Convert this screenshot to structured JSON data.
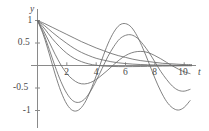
{
  "chart_data": {
    "type": "line",
    "title": "",
    "xlabel": "t",
    "ylabel": "y",
    "xlim": [
      0,
      10.6
    ],
    "ylim": [
      -1.15,
      1.08
    ],
    "grid": false,
    "legend": null,
    "xticks": [
      2,
      4,
      6,
      8,
      10
    ],
    "xtick_labels": [
      "2",
      "4",
      "6",
      "8",
      "10"
    ],
    "yticks": [
      -1,
      -0.5,
      0.5,
      1
    ],
    "ytick_labels": [
      "-1",
      "-0.5",
      "0.5",
      "1"
    ],
    "series": [
      {
        "name": "overdamped-slowest",
        "color": "#6b6b6b",
        "x": [
          0,
          0.5,
          1,
          1.5,
          2,
          2.5,
          3,
          3.5,
          4,
          4.5,
          5,
          5.5,
          6,
          6.5,
          7,
          7.5,
          8,
          8.5,
          9,
          9.5,
          10,
          10.5
        ],
        "y": [
          1.0,
          0.93,
          0.85,
          0.77,
          0.69,
          0.61,
          0.53,
          0.46,
          0.39,
          0.33,
          0.27,
          0.22,
          0.18,
          0.14,
          0.11,
          0.09,
          0.07,
          0.05,
          0.04,
          0.03,
          0.02,
          0.02
        ]
      },
      {
        "name": "overdamped-mid",
        "color": "#6b6b6b",
        "x": [
          0,
          0.5,
          1,
          1.5,
          2,
          2.5,
          3,
          3.5,
          4,
          4.5,
          5,
          5.5,
          6,
          6.5,
          7,
          7.5,
          8,
          8.5,
          9,
          9.5,
          10,
          10.5
        ],
        "y": [
          1.0,
          0.88,
          0.74,
          0.61,
          0.49,
          0.38,
          0.29,
          0.22,
          0.16,
          0.12,
          0.085,
          0.06,
          0.043,
          0.031,
          0.022,
          0.016,
          0.011,
          0.008,
          0.006,
          0.004,
          0.003,
          0.002
        ]
      },
      {
        "name": "critically-damped",
        "color": "#6b6b6b",
        "x": [
          0,
          0.5,
          1,
          1.5,
          2,
          2.5,
          3,
          3.5,
          4,
          4.5,
          5,
          5.5,
          6,
          6.5,
          7,
          7.5,
          8,
          8.5,
          9,
          9.5,
          10,
          10.5
        ],
        "y": [
          1.0,
          0.81,
          0.6,
          0.42,
          0.27,
          0.16,
          0.085,
          0.035,
          0.005,
          -0.012,
          -0.02,
          -0.024,
          -0.025,
          -0.024,
          -0.022,
          -0.019,
          -0.016,
          -0.013,
          -0.011,
          -0.009,
          -0.007,
          -0.006
        ]
      },
      {
        "name": "underdamped-light",
        "color": "#6b6b6b",
        "x": [
          0,
          0.4,
          0.8,
          1.2,
          1.6,
          2.0,
          2.4,
          2.8,
          3.2,
          3.6,
          4.0,
          4.4,
          4.8,
          5.2,
          5.6,
          6.0,
          6.4,
          6.8,
          7.2,
          7.6,
          8.0,
          8.4,
          8.8,
          9.2,
          9.6,
          10.0,
          10.4
        ],
        "y": [
          1.0,
          0.78,
          0.52,
          0.25,
          0.01,
          -0.18,
          -0.31,
          -0.39,
          -0.41,
          -0.38,
          -0.31,
          -0.21,
          -0.1,
          0.02,
          0.13,
          0.22,
          0.28,
          0.31,
          0.31,
          0.28,
          0.22,
          0.15,
          0.07,
          -0.01,
          -0.08,
          -0.14,
          -0.18
        ]
      },
      {
        "name": "underdamped-medium",
        "color": "#6b6b6b",
        "x": [
          0,
          0.4,
          0.8,
          1.2,
          1.6,
          2.0,
          2.4,
          2.8,
          3.2,
          3.6,
          4.0,
          4.4,
          4.8,
          5.2,
          5.6,
          6.0,
          6.4,
          6.8,
          7.2,
          7.6,
          8.0,
          8.4,
          8.8,
          9.2,
          9.6,
          10.0,
          10.4
        ],
        "y": [
          1.0,
          0.72,
          0.36,
          -0.02,
          -0.36,
          -0.62,
          -0.78,
          -0.82,
          -0.75,
          -0.58,
          -0.34,
          -0.07,
          0.2,
          0.42,
          0.59,
          0.67,
          0.68,
          0.61,
          0.47,
          0.29,
          0.08,
          -0.13,
          -0.31,
          -0.46,
          -0.55,
          -0.57,
          -0.53
        ]
      },
      {
        "name": "underdamped-least",
        "color": "#6b6b6b",
        "x": [
          0,
          0.4,
          0.8,
          1.2,
          1.6,
          2.0,
          2.4,
          2.8,
          3.2,
          3.6,
          4.0,
          4.4,
          4.8,
          5.2,
          5.6,
          6.0,
          6.4,
          6.8,
          7.2,
          7.6,
          8.0,
          8.4,
          8.8,
          9.2,
          9.6,
          10.0,
          10.4
        ],
        "y": [
          1.0,
          0.68,
          0.26,
          -0.19,
          -0.58,
          -0.86,
          -1.0,
          -0.99,
          -0.84,
          -0.57,
          -0.23,
          0.14,
          0.48,
          0.74,
          0.9,
          0.93,
          0.85,
          0.65,
          0.37,
          0.05,
          -0.28,
          -0.57,
          -0.8,
          -0.94,
          -0.99,
          -0.93,
          -0.78
        ]
      }
    ]
  },
  "axes": {
    "y_axis_label": "y",
    "x_axis_label": "t"
  }
}
